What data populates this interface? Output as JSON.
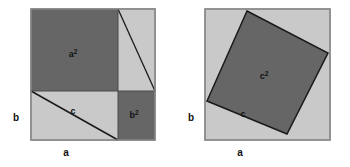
{
  "figure": {
    "background_color": "#ffffff",
    "colors": {
      "light_fill": "#c9c9c9",
      "dark_fill": "#666666",
      "outline": "#8a8a8a",
      "line": "#1a1a1a",
      "text": "#111111"
    },
    "panels": [
      {
        "id": "left-panel",
        "name": "a-squared-plus-b-squared-panel",
        "outer_square": {
          "x": 31,
          "y": 9,
          "size": 124
        },
        "labels": {
          "a_squared": {
            "base": "a",
            "exponent": "2",
            "x": 73,
            "y": 57
          },
          "b_squared": {
            "base": "b",
            "exponent": "2",
            "x": 134,
            "y": 118
          },
          "c": {
            "text": "c",
            "x": 73,
            "y": 114
          },
          "side_b": {
            "text": "b",
            "x": 16,
            "y": 121
          },
          "side_a": {
            "text": "a",
            "x": 66,
            "y": 156
          }
        },
        "regions": [
          {
            "name": "a-squared-region",
            "fill": "dark",
            "points": "31,9 118,9 118,91 31,91"
          },
          {
            "name": "b-squared-region",
            "fill": "dark",
            "points": "118,91 155,91 155,140 118,140"
          },
          {
            "name": "upper-right-light-region",
            "fill": "light",
            "points": "118,9 155,9 155,91 118,91"
          },
          {
            "name": "lower-left-light-region",
            "fill": "light",
            "points": "31,91 118,91 118,140 31,140"
          }
        ],
        "hypotenuse_lines": [
          {
            "name": "upper-triangle-hypotenuse",
            "x1": 118,
            "y1": 9,
            "x2": 155,
            "y2": 91
          },
          {
            "name": "lower-triangle-hypotenuse",
            "x1": 31,
            "y1": 91,
            "x2": 118,
            "y2": 140
          }
        ],
        "divider_lines": [
          {
            "name": "vertical-divider",
            "x1": 118,
            "y1": 9,
            "x2": 118,
            "y2": 140
          },
          {
            "name": "horizontal-divider",
            "x1": 31,
            "y1": 91,
            "x2": 155,
            "y2": 91
          }
        ]
      },
      {
        "id": "right-panel",
        "name": "c-squared-panel",
        "outer_square": {
          "x": 205,
          "y": 9,
          "size": 125
        },
        "tilted_square": {
          "name": "c-squared-region",
          "points": "247,11 328,53 287,134 207,101"
        },
        "labels": {
          "c_squared": {
            "base": "c",
            "exponent": "2",
            "x": 264,
            "y": 79
          },
          "c": {
            "text": "c",
            "x": 243,
            "y": 117
          },
          "side_b": {
            "text": "b",
            "x": 191,
            "y": 121
          },
          "side_a": {
            "text": "a",
            "x": 240,
            "y": 156
          }
        }
      }
    ]
  }
}
